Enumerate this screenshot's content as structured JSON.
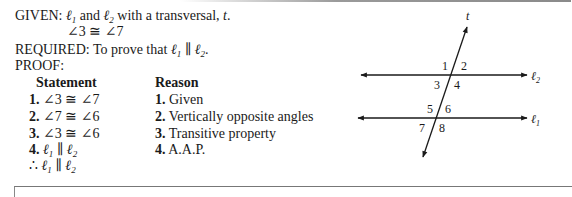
{
  "given": {
    "label": "GIVEN:",
    "text_pre": "and",
    "text_post": "with a transversal,",
    "line1": "ℓ",
    "line1_sub": "1",
    "line2": "ℓ",
    "line2_sub": "2",
    "transversal": "t",
    "period": ".",
    "condition": "∠3 ≅ ∠7"
  },
  "required": {
    "label": "REQUIRED:",
    "text": "To prove that",
    "a": "ℓ",
    "a_sub": "1",
    "parallel": " ∥ ",
    "b": "ℓ",
    "b_sub": "2",
    "period": "."
  },
  "proof": {
    "label": "PROOF:",
    "headers": {
      "statement": "Statement",
      "reason": "Reason"
    },
    "rows": [
      {
        "num": "1.",
        "statement": "∠3 ≅ ∠7",
        "reason_num": "1.",
        "reason": "Given"
      },
      {
        "num": "2.",
        "statement": "∠7 ≅ ∠6",
        "reason_num": "2.",
        "reason": "Vertically opposite angles"
      },
      {
        "num": "3.",
        "statement": "∠3 ≅ ∠6",
        "reason_num": "3.",
        "reason": "Transitive property"
      },
      {
        "num": "4.",
        "statement_a": "ℓ",
        "statement_a_sub": "1",
        "statement_par": " ∥ ",
        "statement_b": "ℓ",
        "statement_b_sub": "2",
        "reason_num": "4.",
        "reason": "A.A.P."
      }
    ],
    "conclusion": {
      "therefore": "∴ ",
      "a": "ℓ",
      "a_sub": "1",
      "par": " ∥ ",
      "b": "ℓ",
      "b_sub": "2"
    }
  },
  "diagram": {
    "transversal_label": "t",
    "line_top_label": "ℓ",
    "line_top_sub": "2",
    "line_bottom_label": "ℓ",
    "line_bottom_sub": "1",
    "angles": [
      "1",
      "2",
      "3",
      "4",
      "5",
      "6",
      "7",
      "8"
    ],
    "stroke_color": "#1a1a1a"
  }
}
